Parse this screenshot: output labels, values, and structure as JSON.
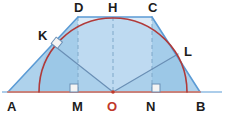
{
  "figure": {
    "type": "geometry-diagram",
    "canvas": {
      "width": 226,
      "height": 116
    },
    "colors": {
      "arc": "#b03a3a",
      "baseline": "#c9817a",
      "outline": "#5b9bd5",
      "fill_outer": "#aed2ec",
      "fill_inner": "#dbeaf7",
      "dashed": "#7fa8c9",
      "radius_line": "#6a8fb5",
      "label": "#1c1c1c",
      "label_center": "#c0392b",
      "right_angle_fill": "#f2f2f2"
    },
    "points": [
      {
        "name": "A",
        "label": "A",
        "x": 8,
        "y": 92,
        "label_x": 7,
        "label_y": 111,
        "center": false
      },
      {
        "name": "B",
        "label": "B",
        "x": 200,
        "y": 92,
        "label_x": 196,
        "label_y": 111,
        "center": false
      },
      {
        "name": "C",
        "label": "C",
        "x": 152,
        "y": 17,
        "label_x": 148,
        "label_y": 12,
        "center": false
      },
      {
        "name": "D",
        "label": "D",
        "x": 78,
        "y": 17,
        "label_x": 74,
        "label_y": 12,
        "center": false
      },
      {
        "name": "H",
        "label": "H",
        "x": 113,
        "y": 17,
        "label_x": 108,
        "label_y": 12,
        "center": false
      },
      {
        "name": "K",
        "label": "K",
        "x": 52,
        "y": 44,
        "label_x": 38,
        "label_y": 38,
        "center": false
      },
      {
        "name": "L",
        "label": "L",
        "x": 178,
        "y": 54,
        "label_x": 185,
        "label_y": 53,
        "center": false
      },
      {
        "name": "M",
        "label": "M",
        "x": 78,
        "y": 92,
        "label_x": 73,
        "label_y": 111,
        "center": false
      },
      {
        "name": "N",
        "label": "N",
        "x": 152,
        "y": 92,
        "label_x": 147,
        "label_y": 111,
        "center": false
      },
      {
        "name": "O",
        "label": "O",
        "x": 113,
        "y": 92,
        "label_x": 108,
        "label_y": 111,
        "center": true
      }
    ],
    "segments": [
      {
        "name": "side-AD",
        "from": "A",
        "to": "D",
        "style": "solid"
      },
      {
        "name": "side-DC",
        "from": "D",
        "to": "C",
        "style": "solid"
      },
      {
        "name": "side-CB",
        "from": "C",
        "to": "B",
        "style": "solid"
      },
      {
        "name": "base-AB",
        "from": "A",
        "to": "B",
        "style": "solid"
      },
      {
        "name": "altitude-DM",
        "from": "D",
        "to": "M",
        "style": "dashed"
      },
      {
        "name": "altitude-CN",
        "from": "C",
        "to": "N",
        "style": "dashed"
      },
      {
        "name": "axis-HO",
        "from": "H",
        "to": "O",
        "style": "dashed"
      },
      {
        "name": "radius-OK",
        "from": "O",
        "to": "K",
        "style": "solid"
      },
      {
        "name": "radius-OL",
        "from": "O",
        "to": "L",
        "style": "solid"
      }
    ],
    "arc": {
      "name": "semicircle",
      "center_x": 113,
      "center_y": 92,
      "radius": 74,
      "start_x": 39,
      "end_x": 187,
      "description": "semicircle on AB centered at O"
    },
    "right_angles": [
      {
        "name": "right-angle-at-K",
        "x": 52,
        "y": 44
      },
      {
        "name": "right-angle-at-M",
        "x": 78,
        "y": 92
      },
      {
        "name": "right-angle-at-N",
        "x": 152,
        "y": 92
      }
    ]
  }
}
